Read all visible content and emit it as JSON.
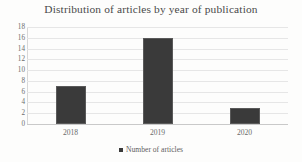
{
  "chart_data": {
    "type": "bar",
    "title": "Distribution of articles by year of publication",
    "categories": [
      "2018",
      "2019",
      "2020"
    ],
    "values": [
      7,
      16,
      3
    ],
    "series": [
      {
        "name": "Number of articles",
        "values": [
          7,
          16,
          3
        ]
      }
    ],
    "xlabel": "",
    "ylabel": "",
    "ylim": [
      0,
      18
    ],
    "ytick_step": 2,
    "yticks": [
      "18",
      "16",
      "14",
      "12",
      "10",
      "8",
      "6",
      "4",
      "2",
      "0"
    ],
    "grid": true,
    "legend_position": "bottom",
    "legend": [
      {
        "label": "Number of articles",
        "color": "#3a3a3a",
        "marker": "square"
      }
    ],
    "colors": {
      "bar": "#3a3a3a",
      "bar_edge": "#5a5a5a",
      "gridline": "#e6e6e6",
      "axis": "#c9c9c9",
      "title_text": "#4a4a4a",
      "tick_text": "#6a6a6a",
      "background": "#fdfdfc"
    }
  }
}
